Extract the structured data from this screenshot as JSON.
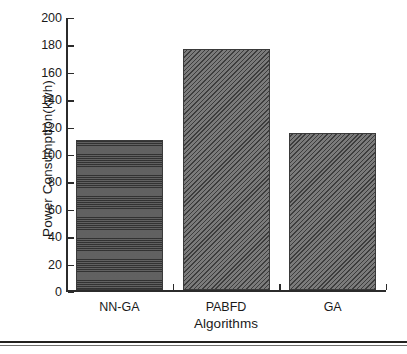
{
  "chart_data": {
    "type": "bar",
    "title": "",
    "xlabel": "Algorithms",
    "ylabel": "Power Consumption(kwh)",
    "categories": [
      "NN-GA",
      "PABFD",
      "GA"
    ],
    "values": [
      110,
      176,
      115
    ],
    "series": [
      {
        "name": "Power Consumption",
        "values": [
          110,
          176,
          115
        ]
      }
    ],
    "ylim": [
      0,
      200
    ],
    "ytick_labels": [
      "0",
      "20",
      "40",
      "60",
      "80",
      "100",
      "120",
      "140",
      "160",
      "180",
      "200"
    ],
    "ytick_values": [
      0,
      20,
      40,
      60,
      80,
      100,
      120,
      140,
      160,
      180,
      200
    ],
    "grid": false,
    "legend": "none",
    "bar_patterns": [
      "horizontal-lines",
      "diagonal-hatch",
      "diagonal-hatch"
    ],
    "bar_colors": [
      "#565656",
      "#6b6b6b",
      "#6b6b6b"
    ],
    "axis_color": "#2b2b2b"
  }
}
